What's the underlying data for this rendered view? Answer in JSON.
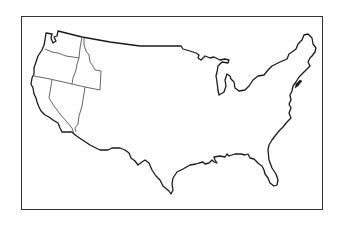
{
  "map": {
    "title": "United States outline map",
    "region": "Contiguous United States",
    "style": "blank outline",
    "highlighted_states": [
      "Washington",
      "Oregon",
      "Idaho",
      "California",
      "Nevada"
    ],
    "colors": {
      "background": "#ffffff",
      "frame": "#333333",
      "outline": "#1a1a1a",
      "state_border": "#555555"
    }
  }
}
